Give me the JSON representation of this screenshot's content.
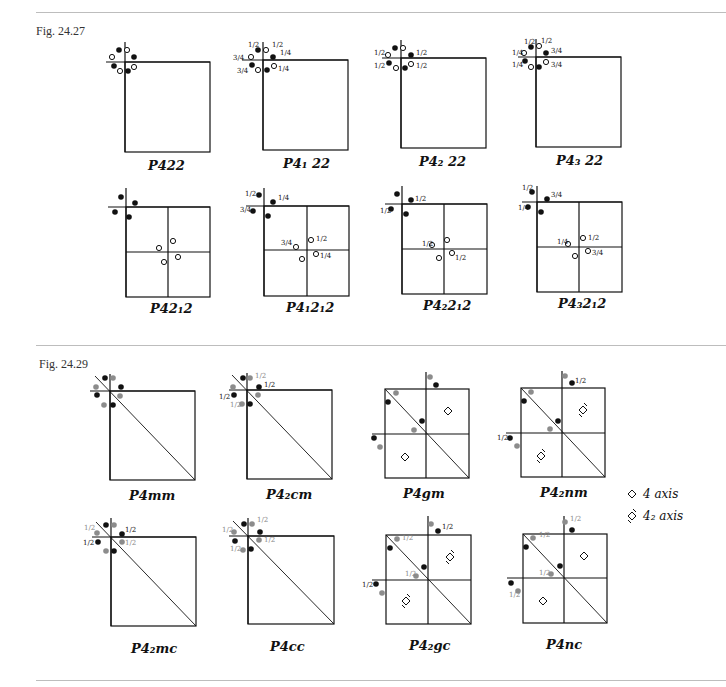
{
  "figures": [
    {
      "label": "Fig. 24.27",
      "panels": [
        {
          "caption": "P422",
          "fractions": []
        },
        {
          "caption": "P4₁ 22",
          "fractions": [
            "3/4",
            "1/2",
            "1/2",
            "1/4",
            "3/4",
            "1/4"
          ]
        },
        {
          "caption": "P4₂ 22",
          "fractions": [
            "1/2",
            "1/2",
            "1/2",
            "1/2"
          ]
        },
        {
          "caption": "P4₃ 22",
          "fractions": [
            "1/2",
            "1/2",
            "1/4",
            "3/4",
            "1/4",
            "3/4"
          ]
        },
        {
          "caption": "P42₁2",
          "fractions": []
        },
        {
          "caption": "P4₁2₁2",
          "fractions": [
            "1/2",
            "1/4",
            "3/4",
            "3/4",
            "1/2",
            "1/4"
          ]
        },
        {
          "caption": "P4₂2₁2",
          "fractions": [
            "1/2",
            "1/2",
            "1/2",
            "1/2"
          ]
        },
        {
          "caption": "P4₃2₁2",
          "fractions": [
            "1/2",
            "3/4",
            "1/4",
            "1/4",
            "1/2",
            "3/4"
          ]
        }
      ]
    },
    {
      "label": "Fig. 24.29",
      "panels": [
        {
          "caption": "P4mm"
        },
        {
          "caption": "P4₂cm"
        },
        {
          "caption": "P4gm"
        },
        {
          "caption": "P4₂nm"
        },
        {
          "caption": "P4₂mc"
        },
        {
          "caption": "P4cc"
        },
        {
          "caption": "P4₂gc"
        },
        {
          "caption": "P4nc"
        }
      ],
      "legend": [
        {
          "symbol": "diamond-icon",
          "label": "4 axis"
        },
        {
          "symbol": "diamond-tail-icon",
          "label": "4₂ axis"
        }
      ]
    }
  ],
  "fraction_text": {
    "half": "1/2",
    "quarter": "1/4",
    "three_quarter": "3/4"
  }
}
